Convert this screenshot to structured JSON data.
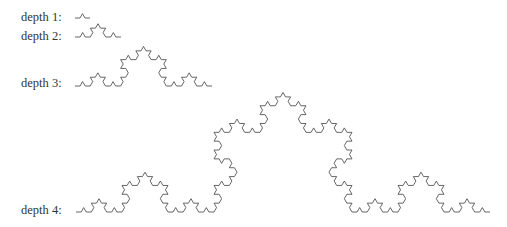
{
  "diagram": {
    "rows": [
      {
        "label": "depth 1:",
        "depth": 1,
        "label_x": 21,
        "label_y": 11,
        "x0": 75,
        "x1": 90,
        "baseline_y": 18
      },
      {
        "label": "depth 2:",
        "depth": 2,
        "label_x": 21,
        "label_y": 30,
        "x0": 75,
        "x1": 121,
        "baseline_y": 37
      },
      {
        "label": "depth 3:",
        "depth": 3,
        "label_x": 21,
        "label_y": 77,
        "x0": 75,
        "x1": 212,
        "baseline_y": 86
      },
      {
        "label": "depth 4:",
        "depth": 4,
        "label_x": 21,
        "label_y": 204,
        "x0": 76,
        "x1": 490,
        "baseline_y": 212
      }
    ],
    "stroke_color": "#555555",
    "label_color": "#333333",
    "background": "#ffffff"
  }
}
